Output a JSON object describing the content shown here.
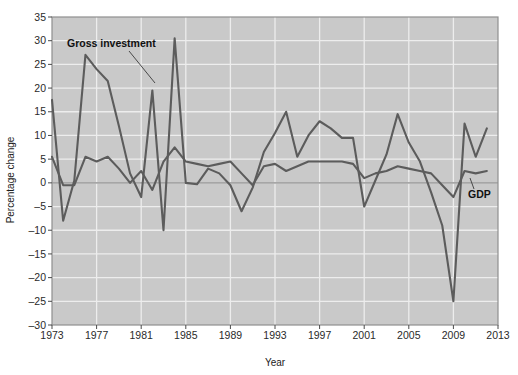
{
  "chart_data": {
    "type": "line",
    "title": "",
    "xlabel": "Year",
    "ylabel": "Percentage change",
    "xlim": [
      1973,
      2013
    ],
    "ylim": [
      -30,
      35
    ],
    "xticks": [
      1973,
      1977,
      1981,
      1985,
      1989,
      1993,
      1997,
      2001,
      2005,
      2009,
      2013
    ],
    "yticks": [
      -30,
      -25,
      -20,
      -15,
      -10,
      -5,
      0,
      5,
      10,
      15,
      20,
      25,
      30,
      35
    ],
    "grid": true,
    "legend_position": "inline-annotations",
    "x": [
      1973,
      1974,
      1975,
      1976,
      1977,
      1978,
      1979,
      1980,
      1981,
      1982,
      1983,
      1984,
      1985,
      1986,
      1987,
      1988,
      1989,
      1990,
      1991,
      1992,
      1993,
      1994,
      1995,
      1996,
      1997,
      1998,
      1999,
      2000,
      2001,
      2002,
      2003,
      2004,
      2005,
      2006,
      2007,
      2008,
      2009,
      2010,
      2011,
      2012
    ],
    "series": [
      {
        "name": "Gross investment",
        "color": "#5c5c5c",
        "values": [
          17.5,
          -8.0,
          0.5,
          27.0,
          24.0,
          21.5,
          12.0,
          2.0,
          -3.0,
          19.5,
          -10.0,
          30.5,
          0.0,
          -0.3,
          3.0,
          2.0,
          -0.5,
          -6.0,
          -1.0,
          6.5,
          10.5,
          15.0,
          5.5,
          10.0,
          13.0,
          11.5,
          9.5,
          9.5,
          -5.0,
          0.5,
          6.0,
          14.5,
          8.5,
          4.5,
          -2.0,
          -9.0,
          -25.0,
          12.5,
          5.5,
          11.5
        ]
      },
      {
        "name": "GDP",
        "color": "#5c5c5c",
        "values": [
          5.5,
          -0.5,
          -0.5,
          5.5,
          4.5,
          5.5,
          3.0,
          0.0,
          2.5,
          -1.5,
          4.5,
          7.5,
          4.5,
          4.0,
          3.5,
          4.0,
          4.5,
          2.0,
          -0.5,
          3.5,
          4.0,
          2.5,
          3.5,
          4.5,
          4.5,
          4.5,
          4.5,
          4.0,
          1.0,
          2.0,
          2.5,
          3.5,
          3.0,
          2.5,
          2.0,
          -0.5,
          -3.0,
          2.5,
          2.0,
          2.5
        ]
      }
    ],
    "annotations": [
      {
        "label": "Gross investment",
        "x": 1974.9,
        "y": 32.0
      },
      {
        "label": "GDP",
        "x": 2010.3,
        "y": 1.6
      }
    ],
    "style": {
      "plot_background": "#c9c9c9",
      "grid_color": "#ededed",
      "zero_line_color": "#a6a6a6",
      "border_color": "#8f8f8f",
      "line_color": "#5c5c5c",
      "text_color": "#2a2a2a"
    }
  }
}
